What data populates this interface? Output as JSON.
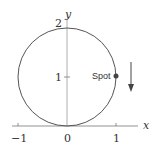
{
  "diagram": {
    "axes": {
      "x_label": "x",
      "y_label": "y",
      "x_ticks": [
        "−1",
        "0",
        "1"
      ],
      "y_ticks": [
        "1",
        "2"
      ]
    },
    "circle": {
      "center": [
        0,
        1
      ],
      "radius": 1
    },
    "spot": {
      "label": "Spot",
      "position": [
        1,
        1
      ]
    },
    "arrow": {
      "direction": "down"
    }
  }
}
